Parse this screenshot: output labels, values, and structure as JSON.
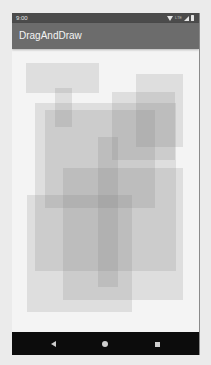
{
  "status_bar": {
    "time": "9:00",
    "icons": [
      "wifi-icon",
      "lte-icon",
      "signal-icon",
      "battery-icon"
    ],
    "lte_label": "LTE"
  },
  "app_bar": {
    "title": "DragAndDraw"
  },
  "canvas": {
    "boxes": [
      {
        "x": 14,
        "y": 14,
        "w": 73,
        "h": 30
      },
      {
        "x": 43,
        "y": 39,
        "w": 17,
        "h": 39
      },
      {
        "x": 124,
        "y": 25,
        "w": 47,
        "h": 73
      },
      {
        "x": 100,
        "y": 43,
        "w": 63,
        "h": 68
      },
      {
        "x": 23,
        "y": 54,
        "w": 141,
        "h": 168
      },
      {
        "x": 33,
        "y": 61,
        "w": 110,
        "h": 98
      },
      {
        "x": 86,
        "y": 88,
        "w": 20,
        "h": 150
      },
      {
        "x": 51,
        "y": 119,
        "w": 120,
        "h": 132
      },
      {
        "x": 15,
        "y": 146,
        "w": 105,
        "h": 117
      }
    ],
    "box_color": "#787878"
  },
  "nav_bar": {
    "buttons": [
      {
        "name": "back",
        "icon": "back-icon"
      },
      {
        "name": "home",
        "icon": "home-icon"
      },
      {
        "name": "recents",
        "icon": "recents-icon"
      }
    ]
  },
  "colors": {
    "status_bar": "#4b4b4b",
    "app_bar": "#6c6c6c",
    "canvas": "#f4f4f4",
    "nav_bar": "#0c0c0c"
  }
}
